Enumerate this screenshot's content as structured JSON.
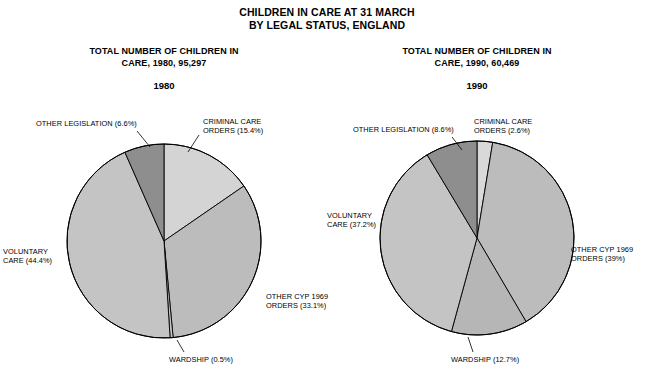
{
  "figure": {
    "title_line1": "CHILDREN IN CARE AT 31 MARCH",
    "title_line2": "BY LEGAL STATUS, ENGLAND",
    "background_color": "#ffffff",
    "outline_color": "#000000"
  },
  "panels": [
    {
      "id": "panel-1980",
      "title_line1": "TOTAL NUMBER OF CHILDREN IN",
      "title_line2": "CARE, 1980, 95,297",
      "year": "1980"
    },
    {
      "id": "panel-1990",
      "title_line1": "TOTAL NUMBER OF CHILDREN IN",
      "title_line2": "CARE, 1990, 60,469",
      "year": "1990"
    }
  ],
  "chart_data": [
    {
      "type": "pie",
      "title": "TOTAL NUMBER OF CHILDREN IN CARE, 1980, 95,297",
      "subtitle": "1980",
      "total": 95297,
      "start_angle_deg": 0,
      "direction": "clockwise",
      "categories": [
        "CRIMINAL CARE ORDERS",
        "OTHER CYP 1969 ORDERS",
        "WARDSHIP",
        "VOLUNTARY CARE",
        "OTHER LEGISLATION"
      ],
      "values": [
        15.4,
        33.1,
        0.5,
        44.4,
        6.6
      ],
      "labels": [
        "CRIMINAL CARE\nORDERS (15.4%)",
        "OTHER CYP 1969\nORDERS (33.1%)",
        "WARDSHIP (0.5%)",
        "VOLUNTARY\nCARE (44.4%)",
        "OTHER LEGISLATION (6.6%)"
      ],
      "colors": [
        "#d4d4d4",
        "#bcbcbc",
        "#c6c6c6",
        "#c4c4c4",
        "#8e8e8e"
      ]
    },
    {
      "type": "pie",
      "title": "TOTAL NUMBER OF CHILDREN IN CARE, 1990, 60,469",
      "subtitle": "1990",
      "total": 60469,
      "start_angle_deg": 0,
      "direction": "clockwise",
      "categories": [
        "CRIMINAL CARE ORDERS",
        "OTHER CYP 1969 ORDERS",
        "WARDSHIP",
        "VOLUNTARY CARE",
        "OTHER LEGISLATION"
      ],
      "values": [
        2.6,
        39.0,
        12.7,
        37.2,
        8.6
      ],
      "labels": [
        "CRIMINAL CARE\nORDERS (2.6%)",
        "OTHER CYP 1969\nORDERS (39%)",
        "WARDSHIP (12.7%)",
        "VOLUNTARY\nCARE (37.2%)",
        "OTHER LEGISLATION (8.6%)"
      ],
      "colors": [
        "#d9d9d9",
        "#bcbcbc",
        "#b6b6b6",
        "#c4c4c4",
        "#8e8e8e"
      ]
    }
  ],
  "labels_1980": {
    "criminal_l1": "CRIMINAL CARE",
    "criminal_l2": "ORDERS (15.4%)",
    "cyp_l1": "OTHER CYP 1969",
    "cyp_l2": "ORDERS (33.1%)",
    "wardship": "WARDSHIP (0.5%)",
    "voluntary_l1": "VOLUNTARY",
    "voluntary_l2": "CARE (44.4%)",
    "other_leg": "OTHER LEGISLATION (6.6%)"
  },
  "labels_1990": {
    "criminal_l1": "CRIMINAL CARE",
    "criminal_l2": "ORDERS (2.6%)",
    "cyp_l1": "OTHER CYP 1969",
    "cyp_l2": "ORDERS (39%)",
    "wardship": "WARDSHIP (12.7%)",
    "voluntary_l1": "VOLUNTARY",
    "voluntary_l2": "CARE (37.2%)",
    "other_leg": "OTHER LEGISLATION (8.6%)"
  }
}
